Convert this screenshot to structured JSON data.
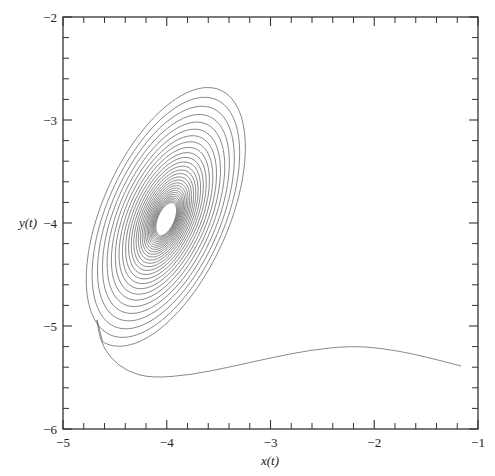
{
  "chart_data": {
    "type": "line",
    "title": "",
    "xlabel": "x(t)",
    "ylabel": "y(t)",
    "xlim": [
      -5,
      -1
    ],
    "ylim": [
      -6,
      -2
    ],
    "grid": false,
    "legend": null,
    "x_ticks": [
      -5,
      -4,
      -3,
      -2,
      -1
    ],
    "x_tick_labels": [
      "−5",
      "−4",
      "−3",
      "−2",
      "−1"
    ],
    "y_ticks": [
      -6,
      -5,
      -4,
      -3,
      -2
    ],
    "y_tick_labels": [
      "−6",
      "−5",
      "−4",
      "−3",
      "−2"
    ],
    "minor_ticks_per_major": 5,
    "series": [
      {
        "name": "trajectory",
        "description": "Phase-plane trajectory starting near (-1.15, -5.4), travelling left along a tail, then spiralling inward (stable focus) toward approx (-4.0, -4.0)",
        "color": "#555555",
        "start_point": [
          -1.15,
          -5.4
        ],
        "tail_points": [
          [
            -1.15,
            -5.4
          ],
          [
            -1.6,
            -5.3
          ],
          [
            -2.3,
            -5.2
          ],
          [
            -3.0,
            -5.28
          ],
          [
            -3.6,
            -5.45
          ],
          [
            -4.1,
            -5.58
          ],
          [
            -4.45,
            -5.52
          ],
          [
            -4.65,
            -5.35
          ],
          [
            -4.75,
            -5.1
          ]
        ],
        "focus": [
          -4.0,
          -4.0
        ],
        "outer_extent": {
          "x": [
            -4.82,
            -3.4
          ],
          "y": [
            -5.3,
            -2.63
          ]
        },
        "inner_hole_extent": {
          "x": [
            -4.12,
            -3.93
          ],
          "y": [
            -4.18,
            -3.82
          ]
        },
        "approx_turns": 28
      }
    ]
  },
  "plot": {
    "box_px": {
      "left": 63,
      "top": 17,
      "right": 478,
      "bottom": 429
    },
    "spiral": {
      "center_px": [
        166,
        219
      ],
      "outer_center_px": [
        164,
        214
      ],
      "angle_deg": -66,
      "a_outer": 142,
      "b_outer": 66,
      "a_inner": 17,
      "b_inner": 8,
      "turns": 28
    },
    "tail_px": [
      [
        461,
        366
      ],
      [
        420,
        355
      ],
      [
        380,
        348
      ],
      [
        350,
        346
      ],
      [
        310,
        350
      ],
      [
        270,
        358
      ],
      [
        230,
        367
      ],
      [
        190,
        375
      ],
      [
        152,
        378
      ],
      [
        128,
        372
      ],
      [
        110,
        358
      ],
      [
        100,
        340
      ],
      [
        97,
        320
      ]
    ]
  },
  "labels": {
    "xlabel": "x(t)",
    "ylabel": "y(t)"
  }
}
